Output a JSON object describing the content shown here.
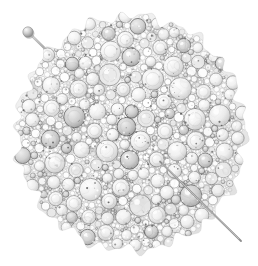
{
  "image": {
    "kind": "product-photograph",
    "subject_title": "Silver granulated disc brooch with pin",
    "background_color": "#ffffff",
    "canvas": {
      "width": 258,
      "height": 266
    },
    "alt_text": "Round silver brooch made of densely packed granules and beads of many sizes, with a long straight pin passing diagonally from upper left to lower right.",
    "caption": ""
  },
  "object": {
    "name": "granulated-disc-brooch",
    "material_label": "silver",
    "shape_label": "round disc",
    "texture_label": "granulation / bead cluster",
    "disc": {
      "center_x": 131,
      "center_y": 133,
      "radius_x": 114,
      "radius_y": 117,
      "edge_label": "irregular lobed rim",
      "lobe_count": 26,
      "lobe_amplitude": 5.5
    },
    "pin": {
      "label": "brooch pin",
      "head_x": 28,
      "head_y": 32,
      "head_radius": 5.2,
      "tip_x": 241,
      "tip_y": 241,
      "shaft_width": 1.7,
      "shaft_color": "#9a9a9a",
      "head_color": "#c8c8c8",
      "head_shadow_color": "#8d8d8d"
    },
    "granulation": {
      "seed": 20240817,
      "bead_count": 1500,
      "min_radius": 1.0,
      "max_radius": 11.5,
      "blob_count": 150,
      "shadow_patch_count": 34
    }
  },
  "palette": {
    "background": "#ffffff",
    "bead_fill_light": "#ffffff",
    "bead_fill_mid": "#e9e9e9",
    "bead_fill_gray": "#cfcfcf",
    "bead_outline": "#8a8a8a",
    "bead_outline_soft": "#b0b0b0",
    "shadow_dark": "#5a5a5a",
    "shadow_deep": "#3c3c3c",
    "highlight": "#fdfdfd",
    "interstice": "#c6c6c6"
  }
}
